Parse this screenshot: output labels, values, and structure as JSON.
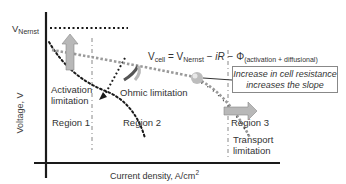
{
  "diagram": {
    "y_axis_label": "Voltage, V",
    "x_axis_label_main": "Current density, A/cm",
    "x_axis_label_sup": "2",
    "v_nernst": {
      "main": "V",
      "sub": "Nernst"
    },
    "equation": {
      "lhs_main": "V",
      "lhs_sub": "cell",
      "eq": " = V",
      "nernst_sub": "Nernst",
      "minus_ir": " − ",
      "ir": "iR",
      "minus_phi": " − Φ",
      "phi_sub": "(activation + diffusional)"
    },
    "annotation_box": {
      "line1": "Increase in cell resistance",
      "line2": "increases the slope"
    },
    "labels": {
      "activation_line1": "Activation",
      "activation_line2": "limitation",
      "ohmic": "Ohmic limitation",
      "region1": "Region 1",
      "region2": "Region 2",
      "region3": "Region 3",
      "transport_line1": "Transport",
      "transport_line2": "limitation"
    },
    "colors": {
      "axis": "#1a1a1a",
      "curve_dotted": "#1a1a1a",
      "curve_gray": "#9a9a9a",
      "arrow_fill": "#b8b8b8",
      "divider": "#888888"
    }
  }
}
